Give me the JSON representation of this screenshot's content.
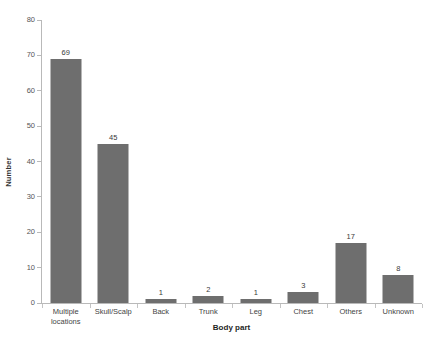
{
  "chart_data": {
    "type": "bar",
    "title": "",
    "xlabel": "Body part",
    "ylabel": "Number",
    "categories": [
      "Multiple locations",
      "Skull/Scalp",
      "Back",
      "Trunk",
      "Leg",
      "Chest",
      "Others",
      "Unknown"
    ],
    "category_lines": [
      [
        "Multiple",
        "locations"
      ],
      [
        "Skull/Scalp"
      ],
      [
        "Back"
      ],
      [
        "Trunk"
      ],
      [
        "Leg"
      ],
      [
        "Chest"
      ],
      [
        "Others"
      ],
      [
        "Unknown"
      ]
    ],
    "values": [
      69,
      45,
      1,
      2,
      1,
      3,
      17,
      8
    ],
    "value_labels": [
      "69",
      "45",
      "1",
      "2",
      "1",
      "3",
      "17",
      "8"
    ],
    "ylim": [
      0,
      80
    ],
    "yticks": [
      0,
      10,
      20,
      30,
      40,
      50,
      60,
      70,
      80
    ],
    "ytick_labels": [
      "0",
      "10",
      "20",
      "30",
      "40",
      "50",
      "60",
      "70",
      "80"
    ],
    "grid": false,
    "legend": null,
    "bar_color": "#6e6e6e",
    "axis_color": "#b9b9b9",
    "background": "#ffffff"
  }
}
